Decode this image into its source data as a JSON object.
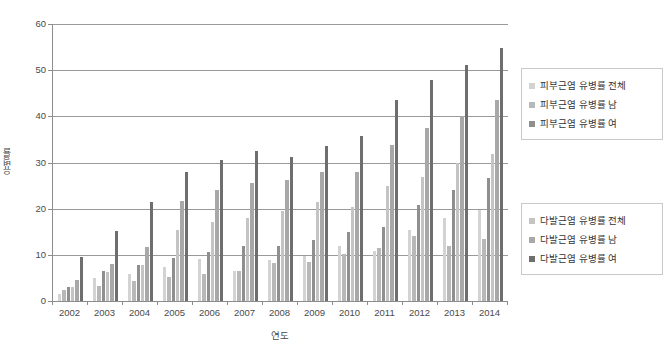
{
  "chart_data": {
    "type": "bar",
    "title": "",
    "xlabel": "연도",
    "ylabel": "유병률",
    "ylim": [
      0,
      60
    ],
    "ytick_step": 10,
    "yticks": [
      0,
      10,
      20,
      30,
      40,
      50,
      60
    ],
    "grid": "horizontal",
    "legend_position": "right",
    "categories": [
      "2002",
      "2003",
      "2004",
      "2005",
      "2006",
      "2007",
      "2008",
      "2009",
      "2010",
      "2011",
      "2012",
      "2013",
      "2014"
    ],
    "series": [
      {
        "name": "피부근염 유병률 전체",
        "color": "#d3d3d3",
        "values": [
          1.6,
          4.9,
          5.9,
          7.3,
          9.0,
          6.4,
          8.9,
          9.7,
          11.9,
          10.9,
          15.4,
          17.9,
          19.8
        ]
      },
      {
        "name": "피부근염 유병률 남",
        "color": "#b8b8b8",
        "values": [
          2.3,
          3.3,
          4.4,
          5.1,
          5.8,
          6.6,
          8.3,
          8.4,
          10.2,
          11.5,
          14.0,
          11.9,
          13.4
        ]
      },
      {
        "name": "피부근염 유병률 여",
        "color": "#8f8f8f",
        "values": [
          3.0,
          6.5,
          7.7,
          9.4,
          10.6,
          11.9,
          11.9,
          13.3,
          15.0,
          16.1,
          20.8,
          24.1,
          26.6
        ]
      },
      {
        "name": "다발근염 유병률 전체",
        "color": "#c4c4c4",
        "values": [
          3.1,
          6.3,
          7.9,
          15.4,
          17.2,
          18.0,
          19.6,
          21.4,
          20.3,
          25.0,
          26.9,
          30.0,
          31.9
        ]
      },
      {
        "name": "다발근염 유병률 남",
        "color": "#a8a8a8",
        "values": [
          4.6,
          8.1,
          11.7,
          21.6,
          24.0,
          25.5,
          26.3,
          27.9,
          28.0,
          33.8,
          37.4,
          40.1,
          43.5
        ]
      },
      {
        "name": "다발근염 유병률 여",
        "color": "#6e6e6e",
        "values": [
          9.6,
          15.1,
          21.5,
          28.0,
          30.6,
          32.6,
          31.2,
          33.5,
          35.8,
          43.5,
          47.8,
          51.2,
          54.7
        ]
      }
    ]
  },
  "axes": {
    "y_title": "유병률",
    "x_title": "연도",
    "y_tick_labels": [
      "60",
      "50",
      "40",
      "30",
      "20",
      "10",
      "0"
    ],
    "x_tick_labels": [
      "2002",
      "2003",
      "2004",
      "2005",
      "2006",
      "2007",
      "2008",
      "2009",
      "2010",
      "2011",
      "2012",
      "2013",
      "2014"
    ]
  },
  "legend_dermatomyositis": {
    "items": [
      {
        "label": "피부근염 유병률 전체",
        "color": "#d3d3d3",
        "swatch_name": "legend-swatch-derm-total"
      },
      {
        "label": "피부근염 유병률 남",
        "color": "#b8b8b8",
        "swatch_name": "legend-swatch-derm-male"
      },
      {
        "label": "피부근염 유병률 여",
        "color": "#8f8f8f",
        "swatch_name": "legend-swatch-derm-female"
      }
    ]
  },
  "legend_polymyositis": {
    "items": [
      {
        "label": "다발근염 유병률 전체",
        "color": "#c4c4c4",
        "swatch_name": "legend-swatch-poly-total"
      },
      {
        "label": "다발근염 유병률 남",
        "color": "#a8a8a8",
        "swatch_name": "legend-swatch-poly-male"
      },
      {
        "label": "다발근염 유병률 여",
        "color": "#6e6e6e",
        "swatch_name": "legend-swatch-poly-female"
      }
    ]
  }
}
